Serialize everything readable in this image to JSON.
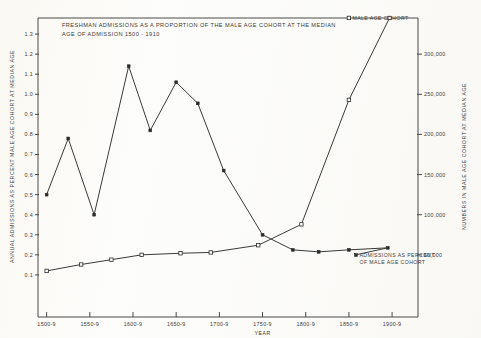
{
  "chart_data": {
    "type": "line",
    "title_line1": "FRESHMAN ADMISSIONS AS A PROPORTION OF THE MALE AGE COHORT AT THE MEDIAN",
    "title_line2": "AGE OF ADMISSION 1500 - 1910",
    "xlabel": "YEAR",
    "ylabel": "ANNUAL ADMISSIONS AS PERCENT MALE AGE COHORT AT MEDIAN AGE",
    "ylabel_right": "NUMBERS IN MALE AGE COHORT AT MEDIAN AGE",
    "categories": [
      "1500-9",
      "1550-9",
      "1600-9",
      "1650-9",
      "1700-9",
      "1750-9",
      "1800-9",
      "1850-9",
      "1900-9"
    ],
    "xticklabels": [
      "1500-9",
      "1550-9",
      "1600-9",
      "1650-9",
      "1700-9",
      "1750-9",
      "1800-9",
      "1850-9",
      "1900-9"
    ],
    "yticklabels": [
      "0.1",
      "0.2",
      "0.3",
      "0.4",
      "0.5",
      "0.6",
      "0.7",
      "0.8",
      "0.9",
      "1.0",
      "1.1",
      "1.2",
      "1.3"
    ],
    "ytickvalues": [
      0.1,
      0.2,
      0.3,
      0.4,
      0.5,
      0.6,
      0.7,
      0.8,
      0.9,
      1.0,
      1.1,
      1.2,
      1.3
    ],
    "yticklabels_right": [
      "50,000",
      "100,000",
      "150,000",
      "200,000",
      "250,000",
      "300,000"
    ],
    "ytickvalues_right": [
      50000,
      100000,
      150000,
      200000,
      250000,
      300000
    ],
    "ylim": [
      0.0,
      1.38
    ],
    "ylim_right": [
      0,
      345000
    ],
    "xlim": [
      1495,
      1935
    ],
    "grid": false,
    "legend_position": "inline-annotations",
    "series": [
      {
        "name": "ADMISSIONS AS PERCENT OF MALE AGE COHORT",
        "marker": "filled-square",
        "axis": "left",
        "x": [
          1505,
          1530,
          1560,
          1600,
          1625,
          1655,
          1680,
          1710,
          1755,
          1790,
          1820,
          1855,
          1900
        ],
        "values": [
          0.5,
          0.78,
          0.4,
          1.14,
          0.82,
          1.06,
          0.955,
          0.62,
          0.3,
          0.225,
          0.215,
          0.225,
          0.235
        ]
      },
      {
        "name": "MALE AGE COHORT",
        "marker": "open-square",
        "axis": "right",
        "x": [
          1505,
          1545,
          1580,
          1615,
          1660,
          1695,
          1750,
          1800,
          1855,
          1902
        ],
        "values": [
          30000,
          38000,
          44000,
          50000,
          52000,
          53000,
          62000,
          88000,
          243000,
          345000
        ]
      }
    ],
    "annotations": [
      {
        "text": "MALE AGE COHORT",
        "marker": "open-square",
        "attach_series": "MALE AGE COHORT"
      },
      {
        "text_line1": "ADMISSIONS AS PERCENT",
        "text_line2": "OF MALE AGE COHORT",
        "marker": "filled-square",
        "attach_series": "ADMISSIONS AS PERCENT OF MALE AGE COHORT"
      }
    ]
  }
}
